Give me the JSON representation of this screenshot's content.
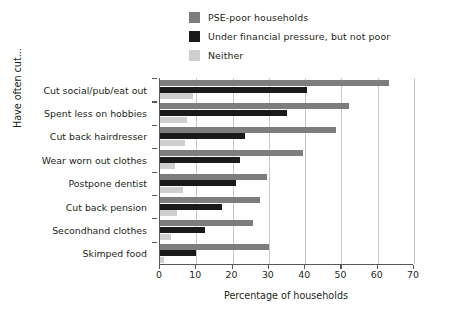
{
  "chart_data": {
    "type": "bar",
    "orientation": "horizontal",
    "title": "",
    "xlabel": "Percentage of households",
    "ylabel": "Have often cut...",
    "xlim": [
      0,
      70
    ],
    "xticks": [
      0,
      10,
      20,
      30,
      40,
      50,
      60,
      70
    ],
    "grid": "vertical",
    "legend_position": "top-center",
    "categories": [
      "Cut social/pub/eat out",
      "Spent less on hobbies",
      "Cut back hairdresser",
      "Wear worn out clothes",
      "Postpone dentist",
      "Cut back pension",
      "Secondhand clothes",
      "Skimped food"
    ],
    "series": [
      {
        "name": "PSE-poor households",
        "color": "#7d7d7d",
        "values": [
          63,
          52,
          48.5,
          39.5,
          29.5,
          27.5,
          25.5,
          30
        ]
      },
      {
        "name": "Under financial pressure, but not poor",
        "color": "#1a1a1a",
        "values": [
          40.5,
          35,
          23.5,
          22,
          21,
          17,
          12.5,
          9.8
        ]
      },
      {
        "name": "Neither",
        "color": "#cfcfcf",
        "values": [
          9,
          7.5,
          6.8,
          4.2,
          6.3,
          4.8,
          3,
          1
        ]
      }
    ]
  },
  "legend": {
    "items": [
      {
        "label": "PSE-poor households",
        "color": "#7d7d7d"
      },
      {
        "label": "Under financial pressure, but not poor",
        "color": "#1a1a1a"
      },
      {
        "label": "Neither",
        "color": "#cfcfcf"
      }
    ]
  },
  "axes": {
    "x_title": "Percentage of households",
    "y_title": "Have often cut...",
    "x_tick_labels": [
      "0",
      "10",
      "20",
      "30",
      "40",
      "50",
      "60",
      "70"
    ]
  },
  "colors": {
    "axis": "#58595b",
    "grid": "#c9c9c9",
    "text": "#231f20",
    "background": "#ffffff"
  }
}
